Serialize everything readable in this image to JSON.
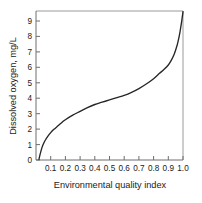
{
  "chart_data": {
    "type": "line",
    "title": "",
    "subtitle": "",
    "xlabel": "Environmental quality index",
    "ylabel": "Dissolved oxygen, mg/L",
    "xlim": [
      0.0,
      1.0
    ],
    "ylim": [
      0.0,
      9.8
    ],
    "xticks": [
      0.1,
      0.2,
      0.3,
      0.4,
      0.5,
      0.6,
      0.7,
      0.8,
      0.9,
      1.0
    ],
    "xtick_labels": [
      "0.1",
      "0.2",
      "0.3",
      "0.4",
      "0.5",
      "0.6",
      "0.7",
      "0.8",
      "0.9",
      "1.0"
    ],
    "yticks": [
      0,
      1,
      2,
      3,
      4,
      5,
      6,
      7,
      8,
      9
    ],
    "ytick_labels": [
      "0",
      "1",
      "2",
      "3",
      "4",
      "5",
      "6",
      "7",
      "8",
      "9"
    ],
    "grid": false,
    "legend": false,
    "legend_position": "none",
    "series": [
      {
        "name": "Dissolved oxygen",
        "color": "#262626",
        "x": [
          0.02,
          0.03,
          0.04,
          0.05,
          0.06,
          0.08,
          0.1,
          0.12,
          0.15,
          0.18,
          0.2,
          0.25,
          0.3,
          0.35,
          0.4,
          0.45,
          0.5,
          0.55,
          0.6,
          0.65,
          0.7,
          0.75,
          0.8,
          0.84,
          0.87,
          0.9,
          0.92,
          0.94,
          0.96,
          0.97,
          0.98,
          0.99,
          0.995,
          1.0
        ],
        "y": [
          0.05,
          0.45,
          0.8,
          1.05,
          1.25,
          1.55,
          1.8,
          2.0,
          2.25,
          2.5,
          2.65,
          2.95,
          3.2,
          3.45,
          3.65,
          3.8,
          3.95,
          4.1,
          4.25,
          4.45,
          4.7,
          5.0,
          5.35,
          5.7,
          5.95,
          6.25,
          6.55,
          6.95,
          7.55,
          7.95,
          8.45,
          9.05,
          9.4,
          9.75
        ]
      }
    ],
    "annotations": []
  },
  "figure": {
    "background_color": "#ffffff",
    "curve_color": "#262626",
    "frame_color": "#9a9a9a",
    "axis_color": "#6e6e6e",
    "text_color": "#1a1a1a"
  },
  "axis_titles": {
    "x": "Environmental quality index",
    "y": "Dissolved oxygen, mg/L"
  }
}
